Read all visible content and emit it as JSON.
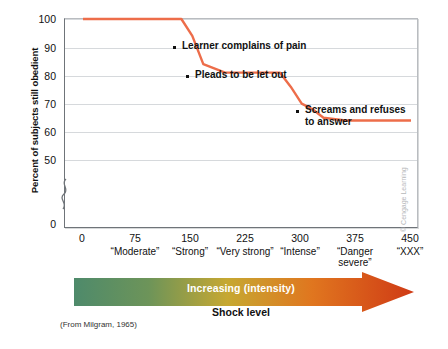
{
  "chart_data": {
    "type": "line",
    "title": "",
    "ylabel": "Percent of subjects still obedient",
    "xlabel": "Shock level",
    "ylim": [
      0,
      100
    ],
    "xlim": [
      0,
      450
    ],
    "yticks": [
      100,
      90,
      80,
      70,
      60,
      50,
      0
    ],
    "axis_break": true,
    "grid": true,
    "xticks": [
      0,
      75,
      150,
      225,
      300,
      375,
      450
    ],
    "xtick_labels": [
      "0",
      "75",
      "150",
      "225",
      "300",
      "375",
      "450"
    ],
    "xcategory_labels": [
      "",
      "“Moderate”",
      "“Strong”",
      "“Very strong”",
      "“Intense”",
      "“Danger\nsevere”",
      "“XXX”"
    ],
    "series": [
      {
        "name": "Percent still obedient",
        "color": "#ed6d4a",
        "x": [
          0,
          120,
          135,
          150,
          165,
          195,
          270,
          285,
          300,
          315,
          330,
          360,
          450
        ],
        "values": [
          100,
          100,
          100,
          94,
          84,
          81,
          81,
          76,
          70,
          68,
          65,
          64,
          64
        ]
      }
    ],
    "annotations": [
      {
        "label": "Learner complains of pain",
        "x": 150,
        "y": 94
      },
      {
        "label": "Pleads to be let out",
        "x": 163,
        "y": 84
      },
      {
        "label": "Screams and refuses\nto answer",
        "x": 285,
        "y": 76
      }
    ],
    "legend": "none"
  },
  "axis": {
    "y_title": "Percent of subjects still obedient",
    "y_ticks": [
      "100",
      "90",
      "80",
      "70",
      "60",
      "50",
      "0"
    ],
    "x_ticks": [
      "0",
      "75",
      "150",
      "225",
      "300",
      "375",
      "450"
    ],
    "x_labels": [
      "“Moderate”",
      "“Strong”",
      "“Very strong”",
      "“Intense”",
      "“Danger severe”",
      "“XXX”"
    ],
    "x_labels_lines": [
      [
        "“Moderate”"
      ],
      [
        "“Strong”"
      ],
      [
        "“Very strong”"
      ],
      [
        "“Intense”"
      ],
      [
        "“Danger",
        "severe”"
      ],
      [
        "“XXX”"
      ]
    ]
  },
  "annotations": {
    "a1": "Learner complains of pain",
    "a2": "Pleads to be let out",
    "a3": "Screams and refuses\nto answer"
  },
  "arrow": {
    "label": "Increasing (intensity)",
    "caption": "Shock level",
    "gradient": [
      "#4e8a6b",
      "#7f9a55",
      "#c6a832",
      "#e0761f",
      "#cf3a15"
    ]
  },
  "source": "(From Milgram, 1965)",
  "credit": "© Cengage Learning",
  "colors": {
    "line": "#ed6d4a",
    "grid": "#d6d9dc",
    "axis": "#6f7479",
    "text": "#111111"
  }
}
